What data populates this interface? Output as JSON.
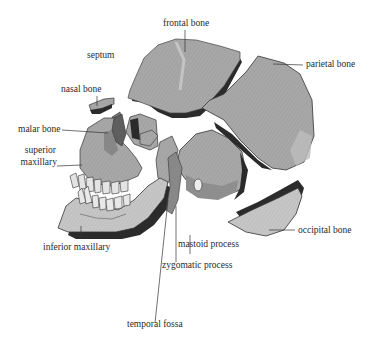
{
  "diagram": {
    "type": "anatomical-illustration",
    "colors": {
      "bone_fill": "#a9a9a9",
      "bone_light": "#c4c4c4",
      "bone_shadow": "#2b2b2b",
      "line": "#333333",
      "text": "#2a2a2a",
      "background": "#ffffff"
    },
    "labels": [
      {
        "id": "frontal",
        "text": "frontal bone"
      },
      {
        "id": "septum",
        "text": "septum"
      },
      {
        "id": "parietal",
        "text": "parietal bone"
      },
      {
        "id": "nasal",
        "text": "nasal bone"
      },
      {
        "id": "malar",
        "text": "malar bone"
      },
      {
        "id": "superior_maxillary",
        "text": "superior maxillary"
      },
      {
        "id": "superior_line1",
        "text": "superior"
      },
      {
        "id": "superior_line2",
        "text": "maxillary"
      },
      {
        "id": "inferior_maxillary",
        "text": "inferior maxillary"
      },
      {
        "id": "mastoid",
        "text": "mastoid process"
      },
      {
        "id": "zygomatic",
        "text": "zygomatic process"
      },
      {
        "id": "occipital",
        "text": "occipital bone"
      },
      {
        "id": "temporal_fossa",
        "text": "temporal fossa"
      }
    ]
  }
}
